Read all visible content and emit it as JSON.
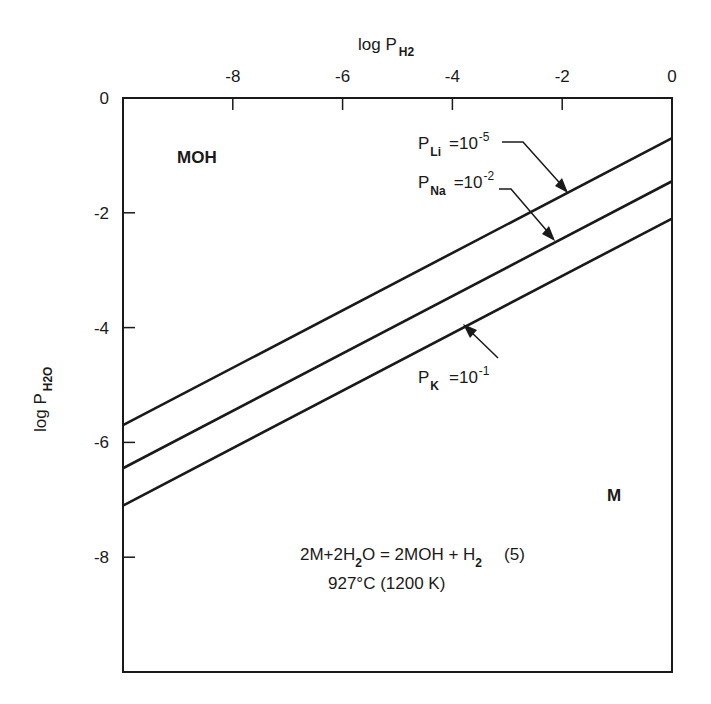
{
  "chart_data": {
    "type": "line",
    "title": "",
    "xlabel": "log P_H2",
    "ylabel": "log P_H2O",
    "x_axis_position": "top",
    "xlim": [
      -10,
      0
    ],
    "ylim": [
      -10,
      0
    ],
    "xticks": [
      -8,
      -6,
      -4,
      -2,
      0
    ],
    "yticks": [
      0,
      -2,
      -4,
      -6,
      -8
    ],
    "grid": false,
    "legend": "none (lines labeled with arrows)",
    "series": [
      {
        "name": "P_Li = 10^-5",
        "species": "Li",
        "label_main": "P",
        "label_sub": "Li",
        "label_eq": "=10",
        "label_exp": "-5",
        "x": [
          -10,
          0
        ],
        "y": [
          -5.7,
          -0.7
        ]
      },
      {
        "name": "P_Na = 10^-2",
        "species": "Na",
        "label_main": "P",
        "label_sub": "Na",
        "label_eq": "=10",
        "label_exp": "-2",
        "x": [
          -10,
          0
        ],
        "y": [
          -6.45,
          -1.45
        ]
      },
      {
        "name": "P_K = 10^-1",
        "species": "K",
        "label_main": "P",
        "label_sub": "K",
        "label_eq": "=10",
        "label_exp": "-1",
        "x": [
          -10,
          0
        ],
        "y": [
          -7.1,
          -2.1
        ]
      }
    ],
    "annotations": [
      {
        "text": "MOH",
        "x": -8.8,
        "y": -1.1,
        "role": "region-label"
      },
      {
        "text": "M",
        "x": -1.1,
        "y": -7.0,
        "role": "region-label"
      },
      {
        "text": "2M+2H2O = 2MOH + H2   (5)",
        "x": -4.6,
        "y": -8.0,
        "role": "reaction"
      },
      {
        "text": "927°C (1200 K)",
        "x": -4.6,
        "y": -8.6,
        "role": "condition"
      }
    ]
  },
  "axes": {
    "x_title_main": "log P",
    "x_title_sub": "H2",
    "y_title_main": "log P",
    "y_title_sub": "H2O",
    "x_tick_labels": [
      "-8",
      "-6",
      "-4",
      "-2",
      "0"
    ],
    "y_tick_labels": [
      "0",
      "-2",
      "-4",
      "-6",
      "-8"
    ]
  },
  "labels": {
    "region_hydroxide": "MOH",
    "region_metal": "M",
    "li": {
      "p": "P",
      "sub": "Li",
      "eq": "=10",
      "exp": "-5"
    },
    "na": {
      "p": "P",
      "sub": "Na",
      "eq": "=10",
      "exp": "-2"
    },
    "k": {
      "p": "P",
      "sub": "K",
      "eq": "=10",
      "exp": "-1"
    },
    "reaction": {
      "a": "2M+2H",
      "a_sub": "2",
      "b": "O = 2MOH + H",
      "b_sub": "2",
      "num": "(5)"
    },
    "condition": "927°C (1200 K)"
  },
  "colors": {
    "ink": "#1a1a1a",
    "background": "#ffffff"
  }
}
